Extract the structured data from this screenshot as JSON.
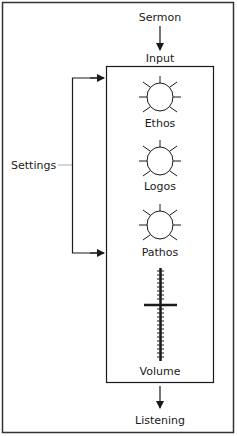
{
  "diagram": {
    "top_input": "Sermon",
    "box_label": "Input",
    "side_label": "Settings",
    "controls": [
      {
        "type": "knob",
        "label": "Ethos"
      },
      {
        "type": "knob",
        "label": "Logos"
      },
      {
        "type": "knob",
        "label": "Pathos"
      },
      {
        "type": "slider",
        "label": "Volume"
      }
    ],
    "output": "Listening"
  },
  "colors": {
    "line": "#1a1a1a",
    "settings_tick": "#aaaaaa",
    "background": "#ffffff"
  }
}
